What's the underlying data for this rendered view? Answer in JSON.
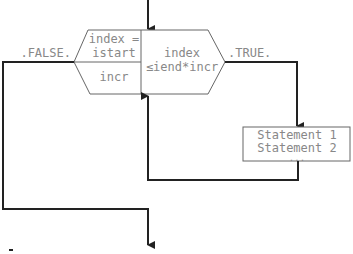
{
  "diagram": {
    "type": "flowchart",
    "loop_block": {
      "init_label_line1": "index =",
      "init_label_line2": "istart",
      "increment_label": "incr",
      "condition_line1": "index",
      "condition_line2": "≤iend*incr"
    },
    "branches": {
      "false_label": ".FALSE.",
      "true_label": ".TRUE."
    },
    "body_block": {
      "line1": "Statement 1",
      "line2": "Statement 2",
      "line3": "..."
    },
    "colors": {
      "line": "#222222",
      "shape_border": "#666666",
      "text": "#888888"
    }
  }
}
